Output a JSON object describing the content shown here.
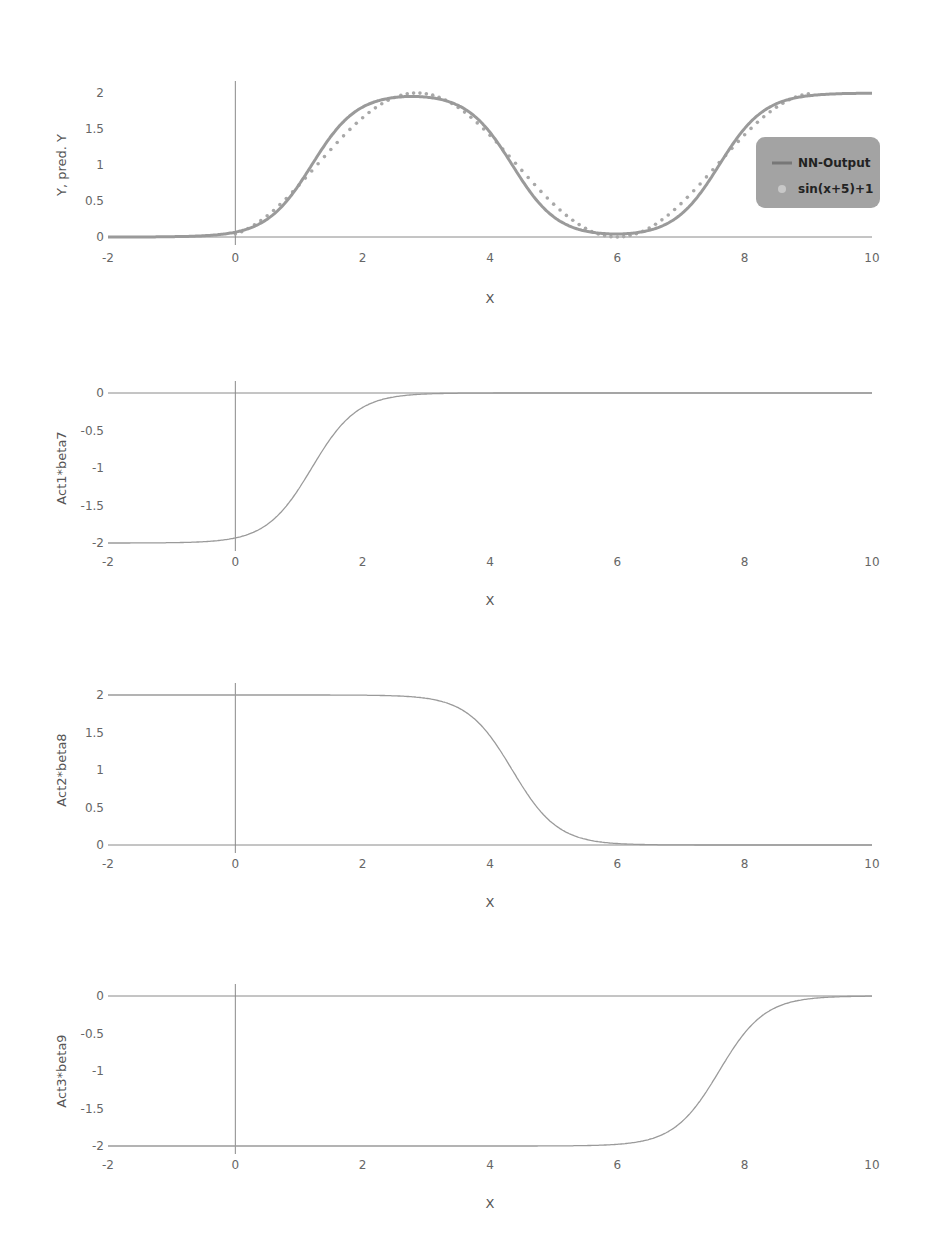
{
  "chart_data": [
    {
      "type": "line",
      "title": "",
      "xlabel": "X",
      "ylabel": "Y, pred. Y",
      "xlim": [
        -2,
        10
      ],
      "ylim": [
        0,
        2
      ],
      "xticks": [
        "-2",
        "0",
        "2",
        "4",
        "6",
        "8",
        "10"
      ],
      "yticks": [
        "0",
        "0.5",
        "1",
        "1.5",
        "2"
      ],
      "grid": false,
      "legend_position": "right",
      "series": [
        {
          "name": "NN-Output",
          "style": "line",
          "function": "sum of three scaled sigmoids approximating sin(x+5)+1"
        },
        {
          "name": "sin(x+5)+1",
          "style": "dots",
          "function": "sin(x+5)+1 sampled for x in [0,9]"
        }
      ],
      "x": [
        -2,
        -1,
        0,
        1,
        2,
        3,
        4,
        5,
        6,
        7,
        8,
        9,
        10
      ],
      "values_nn": [
        0.0,
        0.01,
        0.08,
        0.65,
        1.72,
        1.93,
        1.45,
        0.35,
        0.04,
        0.3,
        1.45,
        1.95,
        2.0
      ],
      "values_true": [
        null,
        null,
        0.04,
        0.72,
        1.66,
        1.99,
        1.41,
        0.46,
        0.0,
        0.46,
        1.42,
        1.99,
        null
      ]
    },
    {
      "type": "line",
      "xlabel": "X",
      "ylabel": "Act1*beta7",
      "xlim": [
        -2,
        10
      ],
      "ylim": [
        -2,
        0
      ],
      "xticks": [
        "-2",
        "0",
        "2",
        "4",
        "6",
        "8",
        "10"
      ],
      "yticks": [
        "-2",
        "-1.5",
        "-1",
        "-0.5",
        "0"
      ],
      "series": [
        {
          "name": "Act1*beta7",
          "x": [
            -2,
            -1,
            0,
            0.5,
            1,
            1.5,
            2,
            2.5,
            3,
            4,
            6,
            10
          ],
          "values": [
            -1.99,
            -1.98,
            -1.92,
            -1.75,
            -1.42,
            -0.95,
            -0.48,
            -0.18,
            -0.06,
            -0.01,
            0,
            0
          ]
        }
      ]
    },
    {
      "type": "line",
      "xlabel": "X",
      "ylabel": "Act2*beta8",
      "xlim": [
        -2,
        10
      ],
      "ylim": [
        0,
        2
      ],
      "xticks": [
        "-2",
        "0",
        "2",
        "4",
        "6",
        "8",
        "10"
      ],
      "yticks": [
        "0",
        "0.5",
        "1",
        "1.5",
        "2"
      ],
      "series": [
        {
          "name": "Act2*beta8",
          "x": [
            -2,
            0,
            2,
            3,
            3.5,
            4,
            4.5,
            5,
            5.5,
            6,
            7,
            10
          ],
          "values": [
            2,
            2,
            1.99,
            1.93,
            1.75,
            1.35,
            0.8,
            0.35,
            0.12,
            0.04,
            0.01,
            0
          ]
        }
      ]
    },
    {
      "type": "line",
      "xlabel": "X",
      "ylabel": "Act3*beta9",
      "xlim": [
        -2,
        10
      ],
      "ylim": [
        -2,
        0
      ],
      "xticks": [
        "-2",
        "0",
        "2",
        "4",
        "6",
        "8",
        "10"
      ],
      "yticks": [
        "-2",
        "-1.5",
        "-1",
        "-0.5",
        "0"
      ],
      "series": [
        {
          "name": "Act3*beta9",
          "x": [
            -2,
            0,
            4,
            5.5,
            6,
            6.5,
            7,
            7.5,
            8,
            8.5,
            9,
            10
          ],
          "values": [
            -2,
            -2,
            -2,
            -1.99,
            -1.96,
            -1.87,
            -1.6,
            -1.05,
            -0.5,
            -0.18,
            -0.06,
            0
          ]
        }
      ]
    }
  ],
  "panels": [
    {
      "ylabel": "Y, pred. Y",
      "xlabel": "X",
      "yticks": [
        "2",
        "1.5",
        "1",
        "0.5",
        "0"
      ]
    },
    {
      "ylabel": "Act1*beta7",
      "xlabel": "X",
      "yticks": [
        "0",
        "-0.5",
        "-1",
        "-1.5",
        "-2"
      ]
    },
    {
      "ylabel": "Act2*beta8",
      "xlabel": "X",
      "yticks": [
        "2",
        "1.5",
        "1",
        "0.5",
        "0"
      ]
    },
    {
      "ylabel": "Act3*beta9",
      "xlabel": "X",
      "yticks": [
        "0",
        "-0.5",
        "-1",
        "-1.5",
        "-2"
      ]
    }
  ],
  "xticks": [
    "-2",
    "0",
    "2",
    "4",
    "6",
    "8",
    "10"
  ],
  "legend": {
    "items": [
      "NN-Output",
      "sin(x+5)+1"
    ]
  },
  "colors": {
    "axis": "#888888",
    "curve": "#999999",
    "nn_line": "#9a9a9a",
    "dots": "#aaaaaa",
    "legend_bg": "#a0a0a0"
  }
}
